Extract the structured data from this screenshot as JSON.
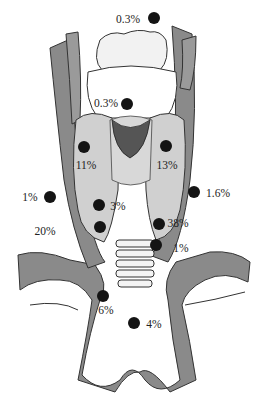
{
  "diagram": {
    "type": "anatomical",
    "colors": {
      "vessel": "#8a8a8a",
      "gland": "#d0d0d0",
      "outline": "#333333",
      "dot": "#141414",
      "text": "#222222"
    },
    "markers": [
      {
        "id": "m1",
        "label": "0.3%",
        "dot": [
          154,
          18
        ],
        "text": [
          128,
          20
        ]
      },
      {
        "id": "m2",
        "label": "0.3%",
        "dot": [
          127,
          104
        ],
        "text": [
          106,
          104
        ]
      },
      {
        "id": "m3",
        "label": "11%",
        "dot": [
          84,
          147
        ],
        "text": [
          86,
          166
        ]
      },
      {
        "id": "m4",
        "label": "13%",
        "dot": [
          166,
          146
        ],
        "text": [
          167,
          166
        ]
      },
      {
        "id": "m5",
        "label": "1%",
        "dot": [
          50,
          197
        ],
        "text": [
          30,
          198
        ]
      },
      {
        "id": "m6",
        "label": "1.6%",
        "dot": [
          194,
          192
        ],
        "text": [
          218,
          194
        ]
      },
      {
        "id": "m7",
        "label": "3%",
        "dot": [
          99,
          205
        ],
        "text": [
          118,
          207
        ]
      },
      {
        "id": "m8",
        "label": "20%",
        "dot": [
          100,
          227
        ],
        "text": [
          45,
          232
        ]
      },
      {
        "id": "m9",
        "label": "38%",
        "dot": [
          159,
          224
        ],
        "text": [
          178,
          224
        ]
      },
      {
        "id": "m10",
        "label": "1%",
        "dot": [
          156,
          245
        ],
        "text": [
          181,
          249
        ]
      },
      {
        "id": "m11",
        "label": "6%",
        "dot": [
          103,
          296
        ],
        "text": [
          106,
          311
        ]
      },
      {
        "id": "m12",
        "label": "4%",
        "dot": [
          134,
          323
        ],
        "text": [
          154,
          325
        ]
      }
    ]
  }
}
